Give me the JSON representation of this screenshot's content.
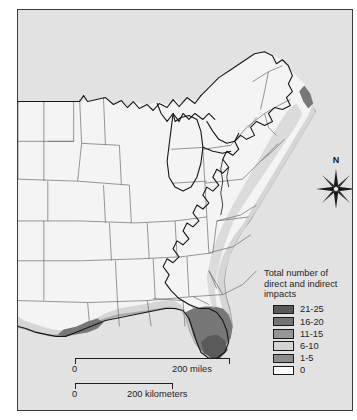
{
  "credit": {
    "text": "NOAA, National Weather Service, and FEMA"
  },
  "map": {
    "title": "Hurricane impacts map of the eastern United States",
    "background_color": "#e2e2e2",
    "land_color": "#f2f2f2",
    "border_color": "#3a3a3a",
    "state_line_color": "#555555",
    "coastline_color": "#1a1a1a"
  },
  "compass": {
    "north_label": "N",
    "icon": "compass-rose-icon"
  },
  "legend": {
    "title": "Total number of direct and indirect impacts",
    "title_line1": "Total number of",
    "title_line2": "direct and indirect",
    "title_line3": "impacts",
    "entries": [
      {
        "label": "21-25",
        "color": "#595959"
      },
      {
        "label": "16-20",
        "color": "#737373"
      },
      {
        "label": "11-15",
        "color": "#969696"
      },
      {
        "label": "6-10",
        "color": "#d4d4d4"
      },
      {
        "label": "1-5",
        "color": "#8c8c8c"
      },
      {
        "label": "0",
        "color": "#fdfdfd"
      }
    ]
  },
  "scale": {
    "miles": {
      "zero": "0",
      "far": "200 miles"
    },
    "kilometers": {
      "zero": "0",
      "far": "200 kilometers"
    }
  }
}
